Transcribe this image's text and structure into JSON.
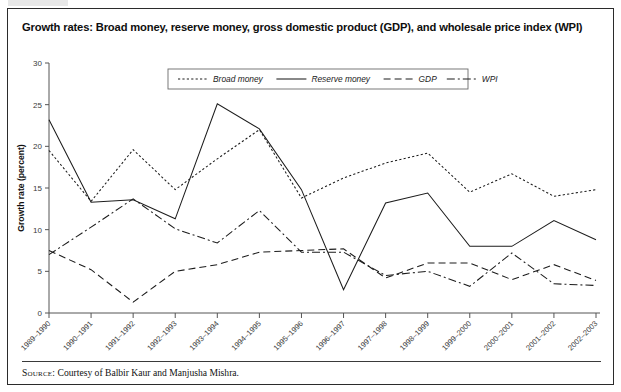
{
  "figure": {
    "title": "Growth rates: Broad money, reserve money, gross domestic product (GDP), and wholesale price index (WPI)",
    "source_label": "Source:",
    "source_text": "Courtesy of Balbir Kaur and Manjusha Mishra."
  },
  "colors": {
    "line": "#1c1c1c",
    "axis": "#555555",
    "frame": "#2b2b2b",
    "background": "#ffffff",
    "text": "#111111"
  },
  "chart_data": {
    "type": "line",
    "title": "Growth rates: Broad money, reserve money, gross domestic product (GDP), and wholesale price index (WPI)",
    "xlabel": "",
    "ylabel": "Growth rate (percent)",
    "ylim": [
      0,
      30
    ],
    "yticks": [
      0,
      5,
      10,
      15,
      20,
      25,
      30
    ],
    "ytick_labels": [
      "0",
      "5",
      "10",
      "15",
      "20",
      "25",
      "30"
    ],
    "grid": false,
    "legend_position": "top-center",
    "categories": [
      "1989–1990",
      "1990–1991",
      "1991–1992",
      "1992–1993",
      "1993–1994",
      "1994–1995",
      "1995–1996",
      "1996–1997",
      "1997–1998",
      "1998–1999",
      "1999–2000",
      "2000–2001",
      "2001–2002",
      "2002–2003"
    ],
    "series": [
      {
        "name": "Broad money",
        "style": "dotted",
        "values": [
          19.5,
          13.4,
          19.6,
          14.8,
          18.5,
          22.0,
          13.8,
          16.2,
          18.0,
          19.2,
          14.5,
          16.7,
          14.0,
          14.8
        ]
      },
      {
        "name": "Reserve money",
        "style": "solid",
        "values": [
          23.2,
          13.3,
          13.6,
          11.3,
          25.1,
          22.1,
          14.8,
          2.8,
          13.2,
          14.4,
          8.0,
          8.0,
          11.1,
          8.8
        ]
      },
      {
        "name": "GDP",
        "style": "dashed",
        "values": [
          7.5,
          5.2,
          1.3,
          5.0,
          5.8,
          7.3,
          7.5,
          7.7,
          4.2,
          6.0,
          6.0,
          4.0,
          5.8,
          3.9
        ]
      },
      {
        "name": "WPI",
        "style": "dashdot",
        "values": [
          7.0,
          10.3,
          13.7,
          10.1,
          8.4,
          12.3,
          7.3,
          7.3,
          4.5,
          5.0,
          3.2,
          7.2,
          3.5,
          3.3
        ]
      }
    ]
  }
}
